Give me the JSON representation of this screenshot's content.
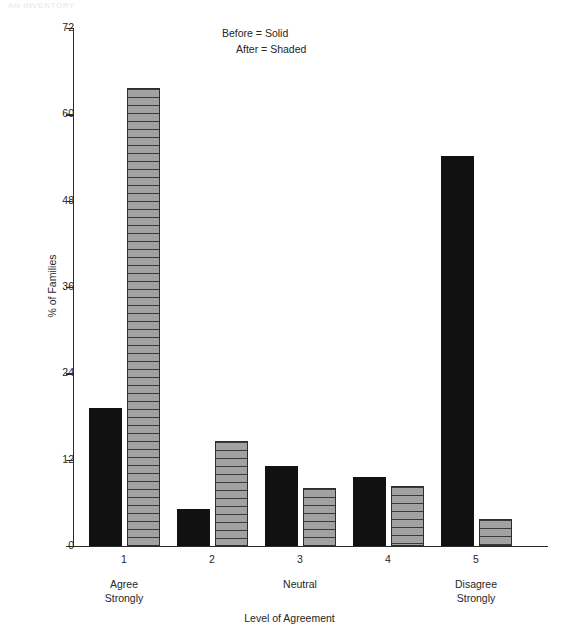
{
  "page": {
    "running_header": "AN  INVENTORY"
  },
  "chart_data": {
    "type": "bar",
    "title": "",
    "xlabel": "Level of Agreement",
    "ylabel": "% of Families",
    "categories": [
      "1",
      "2",
      "3",
      "4",
      "5"
    ],
    "category_descriptions": [
      "Agree\nStrongly",
      "",
      "Neutral",
      "",
      "Disagree\nStrongly"
    ],
    "series": [
      {
        "name": "Before",
        "style": "Solid",
        "values": [
          19.2,
          5.1,
          11.1,
          9.6,
          54.2
        ]
      },
      {
        "name": "After",
        "style": "Shaded",
        "values": [
          63.7,
          14.6,
          8.1,
          8.3,
          3.8
        ]
      }
    ],
    "ylim": [
      0,
      72
    ],
    "yticks": [
      "0",
      "12",
      "24",
      "36",
      "48",
      "60",
      "72"
    ],
    "grid": false,
    "legend_position": "top-center",
    "legend": [
      "Before = Solid",
      "After = Shaded"
    ]
  },
  "legend": {
    "before": "Before = Solid",
    "after": "After = Shaded"
  },
  "axes": {
    "y_title": "% of Families",
    "x_title": "Level of Agreement"
  },
  "colors": {
    "solid_bar": "#111111",
    "shaded_bar_fill": "#9b9b9b",
    "shaded_bar_stripe": "#3a3a3a",
    "axis": "#2b2b2b",
    "text": "#262626",
    "background": "#ffffff"
  }
}
